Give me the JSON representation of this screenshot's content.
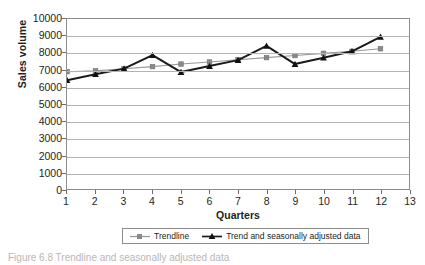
{
  "chart_data": {
    "type": "line",
    "title": "",
    "xlabel": "Quarters",
    "ylabel": "Sales volume",
    "x": [
      1,
      2,
      3,
      4,
      5,
      6,
      7,
      8,
      9,
      10,
      11,
      12
    ],
    "xlim": [
      1,
      13
    ],
    "ylim": [
      0,
      10000
    ],
    "xticks": [
      "1",
      "2",
      "3",
      "4",
      "5",
      "6",
      "7",
      "8",
      "9",
      "10",
      "11",
      "12",
      "13"
    ],
    "yticks": [
      "0",
      "1000",
      "2000",
      "3000",
      "4000",
      "5000",
      "6000",
      "7000",
      "8000",
      "9000",
      "10000"
    ],
    "grid": "horizontal",
    "legend_position": "bottom",
    "series": [
      {
        "name": "Trendline",
        "color": "#999999",
        "marker": "square",
        "values": [
          6900,
          6950,
          7070,
          7200,
          7350,
          7470,
          7600,
          7730,
          7850,
          7980,
          8100,
          8250
        ]
      },
      {
        "name": "Trend and seasonally adjusted data",
        "color": "#1a1a1a",
        "marker": "triangle",
        "values": [
          6400,
          6750,
          7080,
          7880,
          6880,
          7230,
          7580,
          8420,
          7350,
          7720,
          8100,
          8950
        ]
      }
    ]
  },
  "axes": {
    "y_title": "Sales volume",
    "x_title": "Quarters"
  },
  "legend": {
    "entries": [
      {
        "label": "Trendline"
      },
      {
        "label": "Trend and seasonally adjusted data"
      }
    ]
  },
  "caption": {
    "text": "Figure 6.8 Trendline and seasonally adjusted data"
  },
  "colors": {
    "trendline": "#999999",
    "adjusted": "#1a1a1a",
    "gridline": "#b3b3b3",
    "frame": "#8d8d8d",
    "text": "#231f20"
  }
}
